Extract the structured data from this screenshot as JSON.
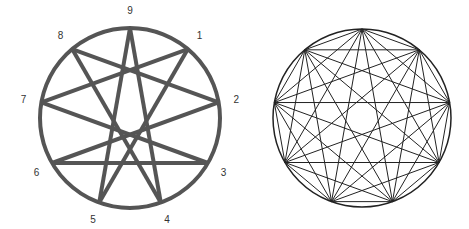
{
  "left": {
    "cx": 130,
    "cy": 118,
    "r": 90,
    "stroke": "#555555",
    "width": 4,
    "labels": [
      "1",
      "2",
      "3",
      "4",
      "5",
      "6",
      "7",
      "8",
      "9"
    ],
    "chords": [
      [
        9,
        4
      ],
      [
        9,
        5
      ],
      [
        1,
        5
      ],
      [
        1,
        7
      ],
      [
        2,
        8
      ],
      [
        2,
        6
      ],
      [
        7,
        3
      ],
      [
        8,
        4
      ],
      [
        6,
        3
      ]
    ]
  },
  "right": {
    "cx": 362,
    "cy": 118,
    "r": 89,
    "stroke": "#222222",
    "width": 1,
    "type": "complete-graph-9"
  }
}
